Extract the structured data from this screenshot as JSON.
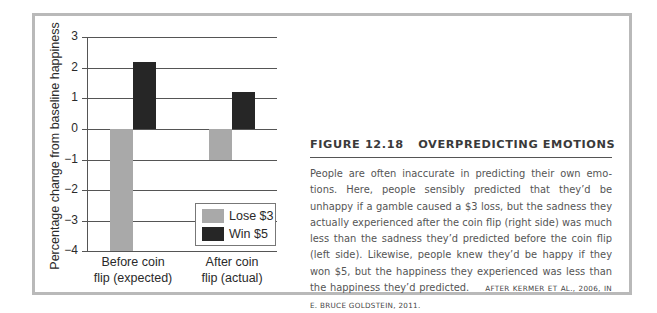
{
  "figure": {
    "number": "FIGURE 12.18",
    "title": "OVERPREDICTING EMOTIONS",
    "caption": "People are often inaccurate in predicting their own emo-tions. Here, people sensibly predicted that they’d be unhappy if a gamble caused a $3 loss, but the sadness they actually experienced after the coin flip (right side) was much less than the sadness they’d predicted before the coin flip (left side). Likewise, people knew they’d be happy if they won $5, but the happiness they experienced was less than the happiness they’d predicted.",
    "credit": "AFTER KERMER ET AL., 2006, IN E. BRUCE GOLDSTEIN, 2011.",
    "border_color": "#b9b9b9"
  },
  "chart": {
    "ylabel": "Percentage change from baseline happiness",
    "ticks": [
      "3",
      "2",
      "1",
      "0",
      "−1",
      "−2",
      "−3",
      "−4"
    ],
    "categories": [
      "Before coin\nflip (expected)",
      "After coin\nflip (actual)"
    ],
    "cat_lines": [
      [
        "Before coin",
        "flip (expected)"
      ],
      [
        "After coin",
        "flip (actual)"
      ]
    ],
    "legend": [
      {
        "label": "Lose $3",
        "color": "#a9a9a9"
      },
      {
        "label": "Win $5",
        "color": "#262626"
      }
    ]
  },
  "chart_data": {
    "type": "bar",
    "title": "",
    "xlabel": "",
    "ylabel": "Percentage change from baseline happiness",
    "categories": [
      "Before coin flip (expected)",
      "After coin flip (actual)"
    ],
    "series": [
      {
        "name": "Lose $3",
        "color": "#a9a9a9",
        "values": [
          -4.0,
          -1.0
        ]
      },
      {
        "name": "Win $5",
        "color": "#262626",
        "values": [
          2.2,
          1.2
        ]
      }
    ],
    "ylim": [
      -4,
      3
    ],
    "yticks": [
      3,
      2,
      1,
      0,
      -1,
      -2,
      -3,
      -4
    ],
    "grid": true,
    "legend_position": "lower right"
  }
}
